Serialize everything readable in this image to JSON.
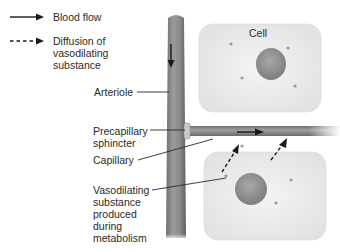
{
  "legend": {
    "items": [
      {
        "style": "solid",
        "label": "Blood flow"
      },
      {
        "style": "dashed",
        "label_lines": [
          "Diffusion of",
          "vasodilating",
          "substance"
        ]
      }
    ]
  },
  "labels": {
    "cell": "Cell",
    "arteriole": "Arteriole",
    "precapillary_sphincter": [
      "Precapillary",
      "sphincter"
    ],
    "capillary": "Capillary",
    "vasodilating_substance": [
      "Vasodilating",
      "substance",
      "produced",
      "during",
      "metabolism"
    ]
  },
  "colors": {
    "vessel": "#8a8a8a",
    "cell_fill": "#ededed",
    "nucleus": "#9a9a9a",
    "text": "#2a2a2a"
  }
}
